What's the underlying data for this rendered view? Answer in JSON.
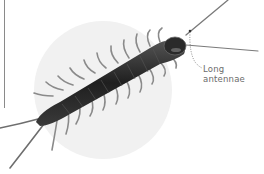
{
  "figure": {
    "annotation": {
      "line1": "Long",
      "line2": "antennae"
    },
    "colors": {
      "background": "#ffffff",
      "backdrop_circle": "#f1f1f1",
      "body": "#2e2e2e",
      "legs": "#7a7a7a",
      "label_text": "#6b6b6b",
      "leader_line": "#6b6b6b",
      "left_rule": "#8a8a8a"
    }
  }
}
